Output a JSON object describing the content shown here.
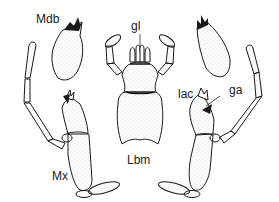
{
  "figure": {
    "colors": {
      "ink": "#1a1a1a",
      "stipple": "#9a9a9a",
      "background": "#ffffff"
    },
    "labels": {
      "mandible": "Mdb",
      "glossa": "gl",
      "lacinia": "lac",
      "galea": "ga",
      "maxilla": "Mx",
      "labium": "Lbm"
    },
    "parts": [
      {
        "id": "left-mandible",
        "label": "Mdb"
      },
      {
        "id": "right-mandible",
        "label": ""
      },
      {
        "id": "labium",
        "label": "Lbm"
      },
      {
        "id": "left-maxilla",
        "label": "Mx"
      },
      {
        "id": "right-maxilla",
        "label": ""
      }
    ]
  }
}
